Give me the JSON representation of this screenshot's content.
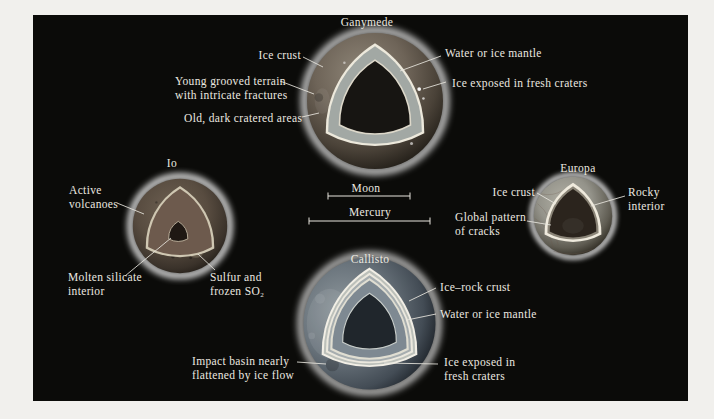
{
  "page": {
    "background": "#f1f0ed",
    "figure_background": "#0b0b09",
    "label_color": "#ece9e0",
    "leader_line_color": "#e9e6df"
  },
  "moons": {
    "ganymede": {
      "title": "Ganymede",
      "labels": {
        "ice_crust": "Ice crust",
        "water_mantle": "Water or ice mantle",
        "young_grooved": [
          "Young grooved terrain",
          "with intricate fractures"
        ],
        "ice_exposed": "Ice exposed in fresh craters",
        "old_dark": "Old, dark cratered areas"
      },
      "colors": {
        "surface": "#6e6458",
        "crust": "#ede9dc",
        "mantle": "#a2a8a4",
        "interior": "#171512"
      }
    },
    "io": {
      "title": "Io",
      "labels": {
        "active": [
          "Active",
          "volcanoes"
        ],
        "molten": [
          "Molten silicate",
          "interior"
        ],
        "sulfur": [
          "Sulfur and",
          "frozen SO₂"
        ]
      },
      "colors": {
        "surface": "#584c40",
        "crust": "#cfc7b2",
        "mantle": "#6d5a4d",
        "core": "#1f1813"
      }
    },
    "europa": {
      "title": "Europa",
      "labels": {
        "ice_crust": "Ice crust",
        "rocky": [
          "Rocky",
          "interior"
        ],
        "global": [
          "Global pattern",
          "of cracks"
        ]
      },
      "colors": {
        "surface": "#94938a",
        "crust": "#efeadd",
        "mantle": "#8a8477",
        "interior": "#2b241d"
      }
    },
    "callisto": {
      "title": "Callisto",
      "labels": {
        "ice_rock": "Ice–rock crust",
        "water_mantle": "Water or ice mantle",
        "impact": [
          "Impact basin nearly",
          "flattened by ice flow"
        ],
        "ice_exposed": [
          "Ice exposed in",
          "fresh craters"
        ]
      },
      "colors": {
        "surface": "#6a747c",
        "crust": "#f2efe6",
        "mantle": "#7e8992",
        "interior": "#20262c"
      }
    }
  },
  "scale_bars": {
    "moon": "Moon",
    "mercury": "Mercury"
  }
}
